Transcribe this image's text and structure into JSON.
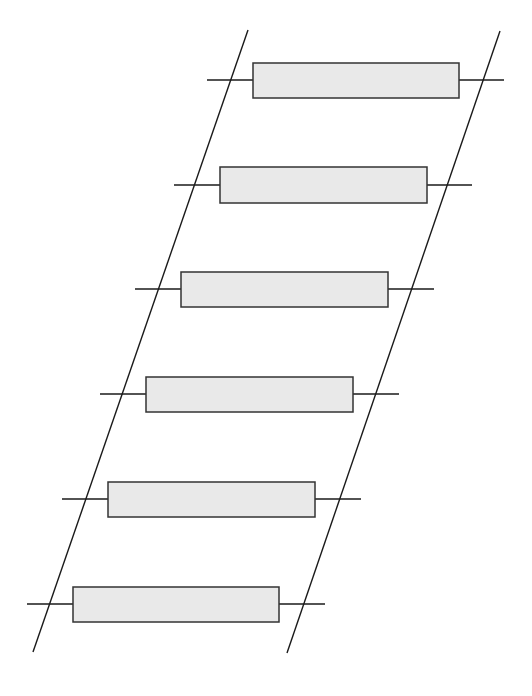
{
  "diagram": {
    "type": "ladder",
    "colors": {
      "background": "#ffffff",
      "stroke": "#1a1a1a",
      "box_fill": "#e9e9e9",
      "box_stroke": "#333333"
    },
    "rails": [
      {
        "name": "left-rail",
        "x1": 248,
        "y1": 30,
        "x2": 33,
        "y2": 652
      },
      {
        "name": "right-rail",
        "x1": 500,
        "y1": 31,
        "x2": 287,
        "y2": 653
      }
    ],
    "rungs": [
      {
        "box": {
          "x": 253,
          "y": 63,
          "w": 206,
          "h": 35
        },
        "lead_y": 80,
        "lead_x1": 207,
        "lead_x2": 504
      },
      {
        "box": {
          "x": 220,
          "y": 167,
          "w": 207,
          "h": 36
        },
        "lead_y": 185,
        "lead_x1": 174,
        "lead_x2": 472
      },
      {
        "box": {
          "x": 181,
          "y": 272,
          "w": 207,
          "h": 35
        },
        "lead_y": 289,
        "lead_x1": 135,
        "lead_x2": 434
      },
      {
        "box": {
          "x": 146,
          "y": 377,
          "w": 207,
          "h": 35
        },
        "lead_y": 394,
        "lead_x1": 100,
        "lead_x2": 399
      },
      {
        "box": {
          "x": 108,
          "y": 482,
          "w": 207,
          "h": 35
        },
        "lead_y": 499,
        "lead_x1": 62,
        "lead_x2": 361
      },
      {
        "box": {
          "x": 73,
          "y": 587,
          "w": 206,
          "h": 35
        },
        "lead_y": 604,
        "lead_x1": 27,
        "lead_x2": 325
      }
    ]
  }
}
